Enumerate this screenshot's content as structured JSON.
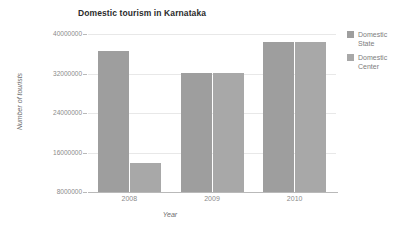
{
  "chart_data": {
    "type": "bar",
    "title": "Domestic tourism in Karnataka",
    "xlabel": "Year",
    "ylabel": "Number of tourists",
    "categories": [
      "2008",
      "2009",
      "2010"
    ],
    "series": [
      {
        "name": "Domestic State",
        "values": [
          36500000,
          32200000,
          38400000
        ],
        "color": "#9e9e9e"
      },
      {
        "name": "Domestic Center",
        "values": [
          13900000,
          32200000,
          38400000
        ],
        "color": "#a8a8a8"
      }
    ],
    "ylim": [
      8000000,
      40000000
    ],
    "yticks": [
      "8000000",
      "16000000",
      "24000000",
      "32000000",
      "40000000"
    ],
    "grid": true,
    "legend_position": "right"
  },
  "legend": {
    "items": [
      {
        "label_line1": "Domestic",
        "label_line2": "State"
      },
      {
        "label_line1": "Domestic",
        "label_line2": "Center"
      }
    ]
  }
}
